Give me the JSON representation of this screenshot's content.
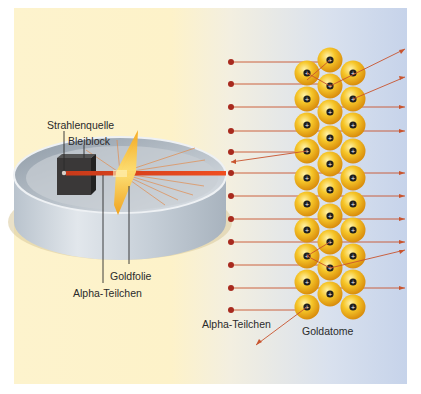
{
  "labels": {
    "source": "Strahlenquelle",
    "lead_block": "Bleiblock",
    "gold_foil": "Goldfolie",
    "alpha_left": "Alpha-Teilchen",
    "alpha_right": "Alpha-Teilchen",
    "gold_atoms": "Goldatome"
  },
  "colors": {
    "beam": "#e8401c",
    "particle": "#a82a1e",
    "trajectory": "#c8542e",
    "gold": "#f2b51a",
    "lead_block": "#3a3838",
    "cylinder": "#c7ced6"
  },
  "alpha_particles_y": [
    62,
    84,
    107,
    131,
    152,
    173,
    196,
    219,
    242,
    265,
    288,
    310
  ],
  "gold_atoms": {
    "left_column_x": 307,
    "middle_column_x": 330,
    "right_column_x": 353,
    "left_y": [
      73,
      99,
      125,
      151,
      178,
      204,
      230,
      256,
      282,
      307
    ],
    "middle_y": [
      60,
      86,
      112,
      138,
      164,
      190,
      216,
      242,
      268,
      294
    ],
    "right_y": [
      73,
      99,
      125,
      151,
      178,
      204,
      230,
      256,
      282,
      307
    ]
  }
}
